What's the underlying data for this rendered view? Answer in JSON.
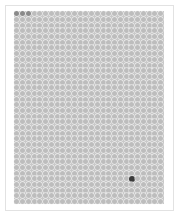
{
  "board": {
    "columns": 26,
    "rows": 34,
    "colors": {
      "frame_border": "#e2e2e2",
      "grid_background": "#c9c9c9",
      "dot_default": "#bdbdbd",
      "dot_dimmed": "#8a8a8a",
      "dot_dark": "#3a3a3a"
    },
    "dimmed_dots": [
      {
        "row": 0,
        "col": 0
      },
      {
        "row": 0,
        "col": 1
      },
      {
        "row": 0,
        "col": 2
      }
    ],
    "dark_dots": [
      {
        "row": 29,
        "col": 20
      }
    ]
  }
}
